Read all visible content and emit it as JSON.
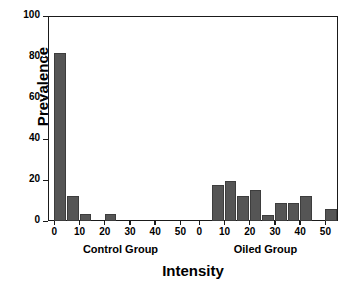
{
  "chart_data": {
    "type": "bar",
    "title": "",
    "xlabel": "Intensity",
    "ylabel": "Prevalence",
    "ylim": [
      0,
      100
    ],
    "yticks": [
      0,
      20,
      40,
      60,
      80,
      100
    ],
    "ytick_labels": [
      "0",
      "20",
      "40",
      "60",
      "80",
      "100"
    ],
    "grid": false,
    "legend": "none",
    "panels": [
      {
        "name": "Control Group",
        "label": "Control Group",
        "xlim": [
          -2.5,
          55
        ],
        "xticks": [
          0,
          10,
          20,
          30,
          40,
          50
        ],
        "xtick_labels": [
          "0",
          "10",
          "20",
          "30",
          "40",
          "50"
        ],
        "x": [
          0,
          5,
          10,
          15,
          20,
          25,
          30,
          35,
          40,
          45,
          50
        ],
        "values": [
          82,
          12,
          3.5,
          0,
          3.5,
          0,
          0,
          0,
          0,
          0,
          0
        ]
      },
      {
        "name": "Oiled Group",
        "label": "Oiled Group",
        "xlim": [
          -2.5,
          55
        ],
        "xticks": [
          0,
          10,
          20,
          30,
          40,
          50
        ],
        "xtick_labels": [
          "0",
          "10",
          "20",
          "30",
          "40",
          "50"
        ],
        "x": [
          0,
          5,
          10,
          15,
          20,
          25,
          30,
          35,
          40,
          45,
          50
        ],
        "values": [
          0,
          17.5,
          19.5,
          12,
          15,
          3,
          9,
          9,
          12,
          0,
          6
        ]
      }
    ],
    "colors": {
      "bar_fill": "#555555",
      "bar_edge": "#3d3d3d",
      "axis": "#1a1a1a",
      "background": "#ffffff",
      "text": "#000000"
    }
  }
}
